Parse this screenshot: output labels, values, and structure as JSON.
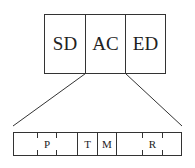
{
  "top_box": {
    "cells": [
      {
        "label": "SD"
      },
      {
        "label": "AC"
      },
      {
        "label": "ED"
      }
    ]
  },
  "bottom_bar": {
    "labels": [
      {
        "label": "P"
      },
      {
        "label": "T"
      },
      {
        "label": "M"
      },
      {
        "label": "R"
      }
    ]
  },
  "colors": {
    "stroke": "#333333",
    "background": "#ffffff"
  }
}
